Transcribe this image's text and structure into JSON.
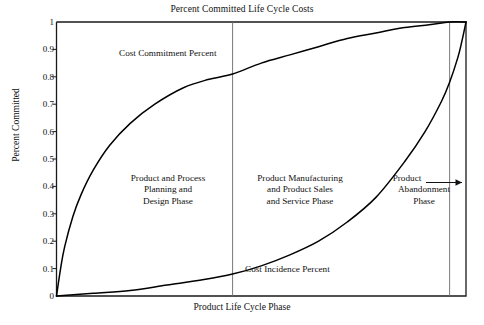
{
  "chart_data": {
    "type": "line",
    "title": "Percent Committed Life Cycle Costs",
    "xlabel": "Product Life Cycle Phase",
    "ylabel": "Percent Committed",
    "xlim": [
      0,
      1
    ],
    "ylim": [
      0,
      1
    ],
    "grid": false,
    "legend": "none",
    "ytick_labels": [
      "1",
      "0.9",
      "0.8",
      "0.7",
      "0.6",
      "0.5",
      "0.4",
      "0.3",
      "0.2",
      "0.1",
      "0"
    ],
    "ytick_values": [
      1,
      0.9,
      0.8,
      0.7,
      0.6,
      0.5,
      0.4,
      0.3,
      0.2,
      0.1,
      0
    ],
    "xtick_labels": [],
    "series": [
      {
        "name": "Cost Commitment Percent",
        "x": [
          0,
          0.01,
          0.02,
          0.04,
          0.06,
          0.09,
          0.13,
          0.18,
          0.24,
          0.31,
          0.37,
          0.43,
          0.5,
          0.57,
          0.64,
          0.71,
          0.78,
          0.85,
          0.91,
          0.96,
          1
        ],
        "y": [
          0,
          0.1,
          0.18,
          0.29,
          0.37,
          0.46,
          0.55,
          0.63,
          0.7,
          0.76,
          0.79,
          0.81,
          0.85,
          0.88,
          0.91,
          0.94,
          0.96,
          0.98,
          0.99,
          1,
          1
        ]
      },
      {
        "name": "Cost Incidence Percent",
        "x": [
          0,
          0.09,
          0.18,
          0.27,
          0.36,
          0.43,
          0.5,
          0.57,
          0.64,
          0.71,
          0.78,
          0.85,
          0.9,
          0.94,
          0.96,
          0.98,
          0.99,
          1
        ],
        "y": [
          0,
          0.01,
          0.02,
          0.04,
          0.06,
          0.08,
          0.11,
          0.15,
          0.2,
          0.27,
          0.36,
          0.49,
          0.6,
          0.71,
          0.78,
          0.87,
          0.93,
          1
        ]
      }
    ],
    "dividers": [
      0.43,
      0.96
    ],
    "annotations": {
      "commitment_label": "Cost Commitment Percent",
      "incidence_label": "Cost Incidence Percent",
      "phase_1": "Product and Process\nPlanning and\nDesign Phase",
      "phase_1_lines": [
        "Product and Process",
        "Planning and",
        "Design Phase"
      ],
      "phase_2_lines": [
        "Product Manufacturing",
        "and Product Sales",
        "and Service Phase"
      ],
      "phase_3_lines": [
        "Product",
        "Abandonment",
        "Phase"
      ],
      "arrow": "right-arrow"
    }
  },
  "chart": {
    "title": "Percent Committed Life Cycle Costs",
    "xlabel": "Product Life Cycle Phase",
    "ylabel": "Percent Committed",
    "commitment_label": "Cost Commitment Percent",
    "incidence_label": "Cost Incidence Percent",
    "ytick0": "1",
    "ytick1": "0.9",
    "ytick2": "0.8",
    "ytick3": "0.7",
    "ytick4": "0.6",
    "ytick5": "0.5",
    "ytick6": "0.4",
    "ytick7": "0.3",
    "ytick8": "0.2",
    "ytick9": "0.1",
    "ytick10": "0",
    "phase1_l1": "Product and Process",
    "phase1_l2": "Planning and",
    "phase1_l3": "Design Phase",
    "phase2_l1": "Product Manufacturing",
    "phase2_l2": "and Product Sales",
    "phase2_l3": "and Service Phase",
    "phase3_l1": "Product",
    "phase3_l2": "Abandonment",
    "phase3_l3": "Phase"
  },
  "colors": {
    "axis": "#1a1a1a",
    "curve": "#000000",
    "divider": "#6b6b6b",
    "text": "#111111",
    "background": "#ffffff"
  }
}
